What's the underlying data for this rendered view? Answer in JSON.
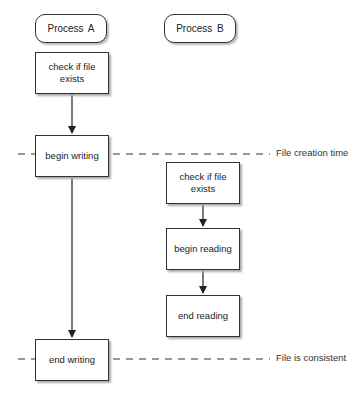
{
  "diagram": {
    "type": "flowchart",
    "lanes": [
      {
        "id": "A",
        "label": "Process A"
      },
      {
        "id": "B",
        "label": "Process B"
      }
    ],
    "nodes": {
      "a_check": "check if file exists",
      "a_begin_writing": "begin writing",
      "a_end_writing": "end writing",
      "b_check": "check if file exists",
      "b_begin_reading": "begin reading",
      "b_end_reading": "end reading"
    },
    "edges": [
      {
        "from": "a_check",
        "to": "a_begin_writing"
      },
      {
        "from": "a_begin_writing",
        "to": "a_end_writing"
      },
      {
        "from": "b_check",
        "to": "b_begin_reading"
      },
      {
        "from": "b_begin_reading",
        "to": "b_end_reading"
      }
    ],
    "markers": [
      {
        "label": "File creation time",
        "style": "dashed"
      },
      {
        "label": "File is consistent",
        "style": "dashed"
      }
    ]
  }
}
